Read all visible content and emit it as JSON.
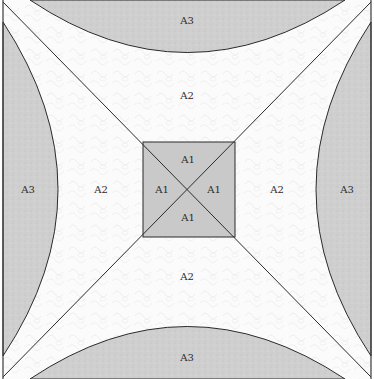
{
  "diagram": {
    "type": "area-partition-square",
    "colors": {
      "a1_fill": "#c9c9c9",
      "a2_fill": "#fbfbfb",
      "a3_fill": "#cfcfcf",
      "stroke": "#2b2b2b"
    },
    "regions": {
      "a3_top": "A3",
      "a3_left": "A3",
      "a3_right": "A3",
      "a3_bottom": "A3",
      "a2_top": "A2",
      "a2_left": "A2",
      "a2_right": "A2",
      "a2_bottom": "A2",
      "a1_top": "A1",
      "a1_left": "A1",
      "a1_right": "A1",
      "a1_bottom": "A1"
    }
  }
}
